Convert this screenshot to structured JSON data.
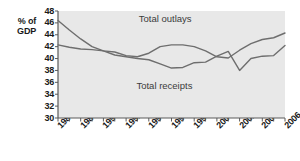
{
  "chart_data": {
    "type": "line",
    "title": "",
    "xlabel": "",
    "ylabel": "% of GDP",
    "ylim": [
      30,
      48
    ],
    "xlim": [
      1986,
      2006
    ],
    "ytick_step": 2,
    "yticks": [
      48,
      46,
      44,
      42,
      40,
      38,
      36,
      34,
      32,
      30
    ],
    "xticks_labeled": [
      1986,
      1988,
      1990,
      1992,
      1994,
      1996,
      1998,
      2000,
      2002,
      2004,
      2006
    ],
    "x": [
      1986,
      1987,
      1988,
      1989,
      1990,
      1991,
      1992,
      1993,
      1994,
      1995,
      1996,
      1997,
      1998,
      1999,
      2000,
      2001,
      2002,
      2003,
      2004,
      2005,
      2006
    ],
    "grid": false,
    "legend_position": "inline-annotations",
    "series": [
      {
        "name": "Total outlays",
        "label": "Total outlays",
        "color": "#6e6e6e",
        "values": [
          46.4,
          44.8,
          43.3,
          42.0,
          41.3,
          41.1,
          40.5,
          40.3,
          40.9,
          42.0,
          42.3,
          42.3,
          42.0,
          41.3,
          40.3,
          40.1,
          41.4,
          42.5,
          43.2,
          43.5,
          44.3
        ]
      },
      {
        "name": "Total receipts",
        "label": "Total receipts",
        "color": "#6e6e6e",
        "values": [
          42.3,
          41.9,
          41.6,
          41.5,
          41.3,
          40.6,
          40.3,
          40.0,
          39.8,
          39.1,
          38.4,
          38.5,
          39.3,
          39.4,
          40.4,
          41.2,
          38.0,
          40.0,
          40.4,
          40.5,
          42.2
        ]
      }
    ],
    "annotations": [
      {
        "text": "Total outlays",
        "x": 1993.2,
        "y": 46.9
      },
      {
        "text": "Total receipts",
        "x": 1993.0,
        "y": 35.6
      }
    ],
    "style": {
      "plot_background": "#e8e8e8",
      "line_color": "#6e6e6e",
      "axis_color": "#5a5a5a",
      "text_color": "#1a1a1a",
      "annotation_color": "#3b3b3b",
      "page_background": "#ffffff"
    }
  }
}
